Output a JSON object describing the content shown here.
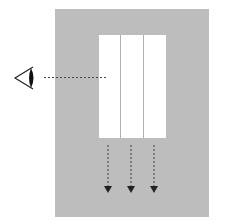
{
  "diagram": {
    "colors": {
      "background": "#ffffff",
      "panel": "#bdbdbd",
      "window": "#ffffff",
      "divider": "#b0b0b0",
      "lines": "#333333"
    },
    "panel": {
      "x": 55,
      "y": 9,
      "w": 154,
      "h": 208
    },
    "window": {
      "x": 99,
      "y": 35,
      "w": 67,
      "h": 103,
      "sections": 3,
      "dividers_x": [
        120,
        143
      ]
    },
    "eye": {
      "x": 14,
      "y": 77,
      "label": "eye-icon"
    },
    "sight_line": {
      "x1": 44,
      "y1": 77,
      "x2": 108,
      "y2": 77,
      "style": "dashed"
    },
    "arrows": [
      {
        "x": 108,
        "y1": 145,
        "y2": 192
      },
      {
        "x": 131,
        "y1": 145,
        "y2": 192
      },
      {
        "x": 154,
        "y1": 145,
        "y2": 192
      }
    ]
  }
}
